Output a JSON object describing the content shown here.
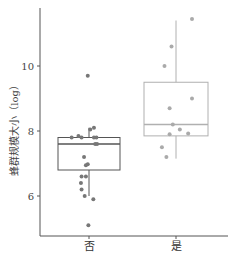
{
  "chart_data": {
    "type": "box",
    "title": "",
    "xlabel": "",
    "ylabel": "蜂群规模大小（log）",
    "categories": [
      "否",
      "是"
    ],
    "yticks": [
      6,
      8,
      10
    ],
    "ylim": [
      4.7,
      11.8
    ],
    "grid": false,
    "legend": null,
    "series": [
      {
        "name": "否",
        "color_box": "#555555",
        "color_points": "#777777",
        "box": {
          "whisker_low": 6.0,
          "q1": 6.8,
          "median": 7.6,
          "q3": 7.8,
          "whisker_high": 8.1
        },
        "points": [
          {
            "dx": -0.02,
            "y": 9.7
          },
          {
            "dx": 0.02,
            "y": 8.05
          },
          {
            "dx": 0.08,
            "y": 8.1
          },
          {
            "dx": -0.28,
            "y": 7.8
          },
          {
            "dx": -0.17,
            "y": 7.85
          },
          {
            "dx": -0.12,
            "y": 7.8
          },
          {
            "dx": 0.08,
            "y": 7.8
          },
          {
            "dx": 0.12,
            "y": 7.8
          },
          {
            "dx": 0.1,
            "y": 7.6
          },
          {
            "dx": 0.13,
            "y": 7.6
          },
          {
            "dx": -0.08,
            "y": 7.2
          },
          {
            "dx": -0.05,
            "y": 6.95
          },
          {
            "dx": -0.02,
            "y": 6.98
          },
          {
            "dx": -0.12,
            "y": 6.6
          },
          {
            "dx": -0.13,
            "y": 6.4
          },
          {
            "dx": -0.12,
            "y": 6.2
          },
          {
            "dx": -0.05,
            "y": 6.6
          },
          {
            "dx": -0.07,
            "y": 6.0
          },
          {
            "dx": 0.07,
            "y": 5.9
          },
          {
            "dx": -0.01,
            "y": 5.1
          }
        ]
      },
      {
        "name": "是",
        "color_box": "#b0b0b0",
        "color_points": "#aaaaaa",
        "box": {
          "whisker_low": 7.15,
          "q1": 7.85,
          "median": 8.2,
          "q3": 9.5,
          "whisker_high": 11.4
        },
        "points": [
          {
            "dx": 0.25,
            "y": 11.45
          },
          {
            "dx": -0.07,
            "y": 10.6
          },
          {
            "dx": -0.18,
            "y": 10.0
          },
          {
            "dx": 0.25,
            "y": 9.0
          },
          {
            "dx": -0.1,
            "y": 8.7
          },
          {
            "dx": -0.05,
            "y": 8.2
          },
          {
            "dx": 0.06,
            "y": 8.05
          },
          {
            "dx": -0.1,
            "y": 7.9
          },
          {
            "dx": 0.19,
            "y": 7.92
          },
          {
            "dx": -0.22,
            "y": 7.5
          },
          {
            "dx": -0.15,
            "y": 7.2
          }
        ]
      }
    ]
  },
  "axis": {
    "y_title": "蜂群规模大小（log）",
    "y_tick_labels": [
      "6",
      "8",
      "10"
    ],
    "x_tick_labels": [
      "否",
      "是"
    ]
  }
}
